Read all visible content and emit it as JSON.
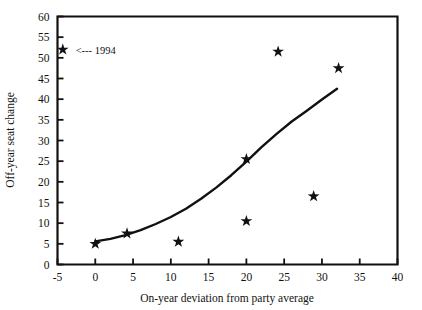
{
  "chart_data": {
    "type": "scatter",
    "title": "",
    "xlabel": "On-year deviation from party average",
    "ylabel": "Off-year seat change",
    "xlim": [
      -5,
      40
    ],
    "ylim": [
      0,
      60
    ],
    "xticks": [
      -5,
      0,
      5,
      10,
      15,
      20,
      25,
      30,
      35,
      40
    ],
    "xtick_labels": [
      "-5",
      "0",
      "5",
      "10",
      "15",
      "20",
      "25",
      "30",
      "35",
      "40"
    ],
    "yticks": [
      0,
      5,
      10,
      15,
      20,
      25,
      30,
      35,
      40,
      45,
      50,
      55,
      60
    ],
    "ytick_labels": [
      "0",
      "5",
      "10",
      "15",
      "20",
      "25",
      "30",
      "35",
      "40",
      "45",
      "50",
      "55",
      "60"
    ],
    "grid": false,
    "legend": false,
    "marker": "star",
    "marker_color": "#111111",
    "series": [
      {
        "name": "observations",
        "points": [
          {
            "x": -4.3,
            "y": 52.0
          },
          {
            "x": 0.0,
            "y": 5.0
          },
          {
            "x": 4.2,
            "y": 7.5
          },
          {
            "x": 11.0,
            "y": 5.5
          },
          {
            "x": 20.0,
            "y": 25.5
          },
          {
            "x": 20.0,
            "y": 10.5
          },
          {
            "x": 24.2,
            "y": 51.5
          },
          {
            "x": 28.9,
            "y": 16.5
          },
          {
            "x": 32.2,
            "y": 47.5
          }
        ]
      },
      {
        "name": "fitted-curve",
        "type": "line",
        "points": [
          {
            "x": 0.0,
            "y": 5.6
          },
          {
            "x": 2.0,
            "y": 6.2
          },
          {
            "x": 4.0,
            "y": 7.1
          },
          {
            "x": 6.0,
            "y": 8.3
          },
          {
            "x": 8.0,
            "y": 9.8
          },
          {
            "x": 10.0,
            "y": 11.5
          },
          {
            "x": 12.0,
            "y": 13.5
          },
          {
            "x": 14.0,
            "y": 15.9
          },
          {
            "x": 16.0,
            "y": 18.6
          },
          {
            "x": 18.0,
            "y": 21.6
          },
          {
            "x": 20.0,
            "y": 24.9
          },
          {
            "x": 22.0,
            "y": 28.4
          },
          {
            "x": 24.0,
            "y": 31.6
          },
          {
            "x": 26.0,
            "y": 34.6
          },
          {
            "x": 28.0,
            "y": 37.2
          },
          {
            "x": 30.0,
            "y": 39.9
          },
          {
            "x": 32.0,
            "y": 42.5
          }
        ]
      }
    ],
    "annotations": [
      {
        "name": "1994-callout",
        "text": "<--- 1994",
        "x": -2.6,
        "y": 52.0
      }
    ]
  }
}
